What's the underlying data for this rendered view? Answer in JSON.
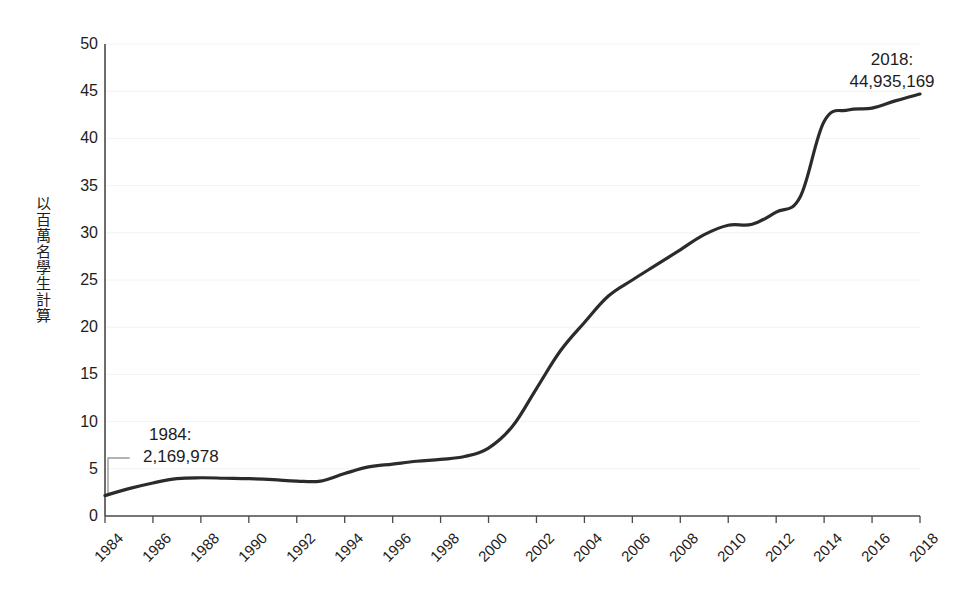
{
  "chart_data": {
    "type": "line",
    "title": "",
    "subtitle": "",
    "xlabel": "",
    "ylabel": "以百萬名學生計算",
    "xlim": [
      1984,
      2018
    ],
    "ylim": [
      0,
      50
    ],
    "grid": true,
    "legend": false,
    "legend_position": "none",
    "y_ticks": [
      0,
      5,
      10,
      15,
      20,
      25,
      30,
      35,
      40,
      45,
      50
    ],
    "y_tick_labels": [
      "0",
      "5",
      "10",
      "15",
      "20",
      "25",
      "30",
      "35",
      "40",
      "45",
      "50"
    ],
    "x_ticks": [
      1984,
      1986,
      1988,
      1990,
      1992,
      1994,
      1996,
      1998,
      2000,
      2002,
      2004,
      2006,
      2008,
      2010,
      2012,
      2014,
      2016,
      2018
    ],
    "x_tick_labels": [
      "1984",
      "1986",
      "1988",
      "1990",
      "1992",
      "1994",
      "1996",
      "1998",
      "2000",
      "2002",
      "2004",
      "2006",
      "2008",
      "2010",
      "2012",
      "2014",
      "2016",
      "2018"
    ],
    "series": [
      {
        "name": "以百萬名學生計算",
        "color": "#2b2b2b",
        "x": [
          1984,
          1985,
          1986,
          1987,
          1988,
          1989,
          1990,
          1991,
          1992,
          1993,
          1994,
          1995,
          1996,
          1997,
          1998,
          1999,
          2000,
          2001,
          2002,
          2003,
          2004,
          2005,
          2006,
          2007,
          2008,
          2009,
          2010,
          2011,
          2012,
          2013,
          2014,
          2015,
          2016,
          2017,
          2018
        ],
        "values": [
          2.17,
          2.9,
          3.5,
          3.95,
          4.05,
          4.0,
          3.95,
          3.85,
          3.7,
          3.7,
          4.5,
          5.2,
          5.5,
          5.8,
          6.0,
          6.3,
          7.2,
          9.5,
          13.5,
          17.5,
          20.5,
          23.3,
          25.0,
          26.6,
          28.2,
          29.8,
          30.8,
          30.9,
          32.2,
          33.8,
          41.8,
          43.0,
          43.2,
          44.0,
          44.7
        ]
      }
    ],
    "annotations": [
      {
        "id": "1984",
        "line1": "1984:",
        "line2": "2,169,978",
        "anchor_x": 1984,
        "anchor_y": 2.169978,
        "leader": true
      },
      {
        "id": "2018",
        "line1": "2018:",
        "line2": "44,935,169",
        "anchor_x": 2018,
        "anchor_y": 44.935169,
        "leader": false
      }
    ],
    "colors": {
      "line": "#2b2b2b",
      "axis": "#4a4a4a",
      "grid": "#f2f2f2",
      "leader": "#9a9a9a",
      "text": "#1d1d1d",
      "background": "#ffffff"
    }
  },
  "axes": {
    "y_title": "以百萬名學生計算"
  }
}
